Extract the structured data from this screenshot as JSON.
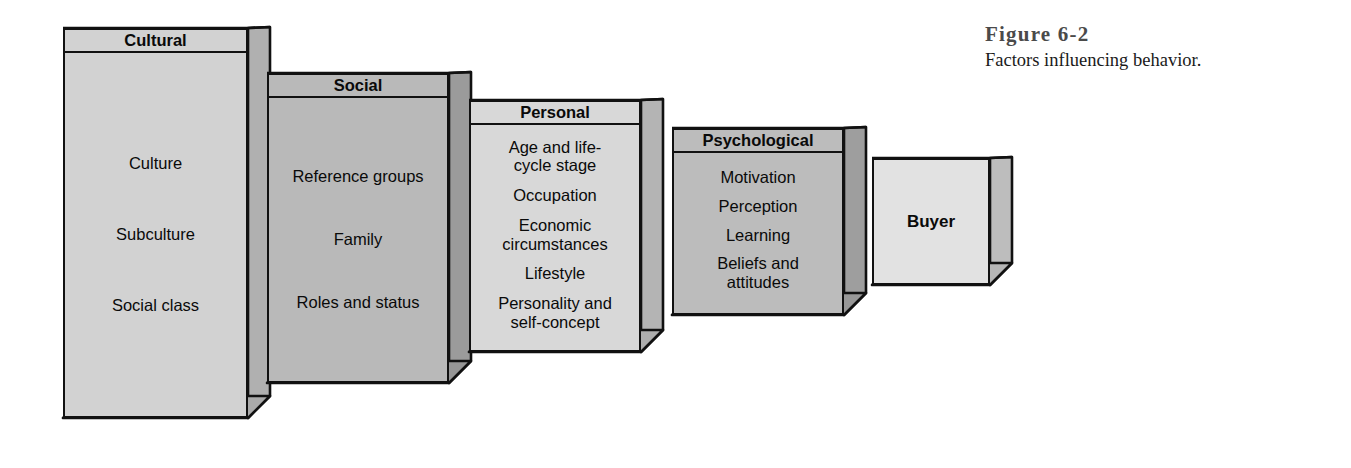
{
  "figure": {
    "title": "Figure 6-2",
    "subtitle": "Factors influencing behavior."
  },
  "diagram": {
    "type": "sequence-of-3d-boxes",
    "boxes": [
      {
        "id": "cultural",
        "header": "Cultural",
        "items": [
          "Culture",
          "Subculture",
          "Social class"
        ],
        "fill": "#d2d2d2",
        "side_fill": "#b0b0b0",
        "bottom_fill": "#aaaaaa"
      },
      {
        "id": "social",
        "header": "Social",
        "items": [
          "Reference groups",
          "Family",
          "Roles and status"
        ],
        "fill": "#b9b9b9",
        "side_fill": "#9b9b9b",
        "bottom_fill": "#969696"
      },
      {
        "id": "personal",
        "header": "Personal",
        "items": [
          "Age and life-\ncycle stage",
          "Occupation",
          "Economic\ncircumstances",
          "Lifestyle",
          "Personality and\nself-concept"
        ],
        "fill": "#d8d8d8",
        "side_fill": "#b4b4b4",
        "bottom_fill": "#aeaeae"
      },
      {
        "id": "psychological",
        "header": "Psychological",
        "items": [
          "Motivation",
          "Perception",
          "Learning",
          "Beliefs and\nattitudes"
        ],
        "fill": "#bcbcbc",
        "side_fill": "#9e9e9e",
        "bottom_fill": "#989898"
      },
      {
        "id": "buyer",
        "header": "",
        "items": [
          "Buyer"
        ],
        "fill": "#e2e2e2",
        "side_fill": "#bdbdbd",
        "bottom_fill": "#b6b6b6"
      }
    ]
  },
  "colors": {
    "outline": "#111111",
    "page_background": "#ffffff",
    "text": "#0a0a0a",
    "caption_title": "#4a4a4a"
  }
}
